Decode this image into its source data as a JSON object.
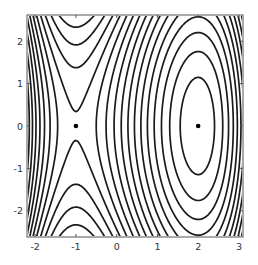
{
  "chart_data": {
    "type": "contour",
    "title": "",
    "xlabel": "",
    "ylabel": "",
    "function": "f(x,y) = x^3/3 - x^2/2 - 2x + 0.2*y^2",
    "function_coeffs": {
      "x3": 0.3333333,
      "x2": -0.5,
      "x1": -2.0,
      "y2": 0.2
    },
    "xlim": [
      -2.2,
      3.1
    ],
    "ylim": [
      -2.62,
      2.62
    ],
    "x_ticks": [
      -2,
      -1,
      0,
      1,
      2,
      3
    ],
    "x_tick_labels": [
      "-2",
      "-1",
      "0",
      "1",
      "2",
      "3"
    ],
    "y_ticks": [
      -2,
      -1,
      0,
      1,
      2
    ],
    "y_tick_labels": [
      "-2",
      "-1",
      "0",
      "1",
      "2"
    ],
    "contour_levels": {
      "base": 1.19,
      "step": 0.355,
      "count_below": 13,
      "count_above": 14
    },
    "critical_points": [
      {
        "name": "saddle",
        "x": -1,
        "y": 0
      },
      {
        "name": "minimum",
        "x": 2,
        "y": 0
      }
    ],
    "grid": false,
    "legend": null,
    "colors": {
      "contour": "#1a1a1a",
      "frame": "#555555",
      "points": "#000000"
    }
  },
  "layout": {
    "plot_px": {
      "left": 27,
      "top": 15,
      "right": 243,
      "bottom": 237
    }
  }
}
